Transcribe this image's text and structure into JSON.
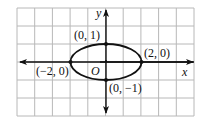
{
  "figure": {
    "grid": {
      "cols": 10,
      "rows": 6,
      "x0": 17,
      "y0": 8,
      "x1": 194,
      "y1": 116,
      "color": "#b8b8b8"
    },
    "origin_px": {
      "x": 106,
      "y": 62
    },
    "unit_px": {
      "x": 17.7,
      "y": 18
    },
    "axes": {
      "x_label": "x",
      "y_label": "y",
      "origin_label": "O",
      "color": "#111111"
    },
    "curve": {
      "type": "ellipse",
      "center": [
        0,
        0
      ],
      "a": 2,
      "b": 1,
      "color": "#111111"
    },
    "points": [
      {
        "coords": [
          0,
          1
        ],
        "label": "(0, 1)"
      },
      {
        "coords": [
          2,
          0
        ],
        "label": "(2, 0)"
      },
      {
        "coords": [
          -2,
          0
        ],
        "label": "(−2, 0)"
      },
      {
        "coords": [
          0,
          -1
        ],
        "label": "(0, −1)"
      }
    ]
  }
}
